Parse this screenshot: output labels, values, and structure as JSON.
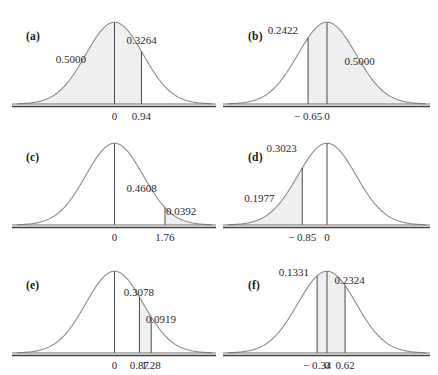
{
  "figure": {
    "top_fragment": "",
    "curve_color": "#8c8c8c",
    "fill_color": "#efefef",
    "shade_color": "#e2e2e2",
    "axis_color": "#6f6f6f",
    "rule_color": "#3d3d3d"
  },
  "chart_data": {
    "type": "area",
    "title": "",
    "xlabel": "",
    "ylabel": "",
    "distribution": "standard normal",
    "xlim": [
      -3.4,
      3.4
    ],
    "ylim": [
      0,
      0.4
    ],
    "grid": false,
    "legend": null,
    "panels": [
      {
        "id": "a",
        "label": "(a)",
        "ticks": [
          {
            "value": 0,
            "text": "0"
          },
          {
            "value": 0.94,
            "text": "0.94"
          }
        ],
        "rules": [
          0,
          0.94
        ],
        "shaded": [
          {
            "from": -3.4,
            "to": 0.94
          }
        ],
        "annotations": [
          {
            "text": "0.5000",
            "x": -1.42,
            "y": 0.215
          },
          {
            "text": "0.3264",
            "x": 1.05,
            "y": 0.305
          }
        ]
      },
      {
        "id": "b",
        "label": "(b)",
        "ticks": [
          {
            "value": -0.65,
            "text": "− 0.65"
          },
          {
            "value": 0,
            "text": "0"
          }
        ],
        "rules": [
          -0.65,
          0
        ],
        "shaded": [
          {
            "from": -0.65,
            "to": 3.4
          }
        ],
        "annotations": [
          {
            "text": "0.2422",
            "x": -1.42,
            "y": 0.355
          },
          {
            "text": "0.5000",
            "x": 1.22,
            "y": 0.205
          }
        ]
      },
      {
        "id": "c",
        "label": "(c)",
        "ticks": [
          {
            "value": 0,
            "text": "0"
          },
          {
            "value": 1.76,
            "text": "1.76"
          }
        ],
        "rules": [
          0,
          1.76
        ],
        "shaded": [
          {
            "from": 1.76,
            "to": 3.4
          }
        ],
        "annotations": [
          {
            "text": "0.4608",
            "x": 1.05,
            "y": 0.175
          },
          {
            "text": "0.0392",
            "x": 2.42,
            "y": 0.062
          }
        ]
      },
      {
        "id": "d",
        "label": "(d)",
        "ticks": [
          {
            "value": -0.85,
            "text": "− 0.85"
          },
          {
            "value": 0,
            "text": "0"
          }
        ],
        "rules": [
          -0.85,
          0
        ],
        "shaded": [
          {
            "from": -3.4,
            "to": -0.85
          }
        ],
        "annotations": [
          {
            "text": "0.3023",
            "x": -1.46,
            "y": 0.372
          },
          {
            "text": "0.1977",
            "x": -2.22,
            "y": 0.125
          }
        ]
      },
      {
        "id": "e",
        "label": "(e)",
        "ticks": [
          {
            "value": 0,
            "text": "0"
          },
          {
            "value": 0.87,
            "text": "0.87"
          },
          {
            "value": 1.28,
            "text": "1.28"
          }
        ],
        "rules": [
          0,
          0.87,
          1.28
        ],
        "shaded": [
          {
            "from": 0.87,
            "to": 1.28
          }
        ],
        "annotations": [
          {
            "text": "0.3078",
            "x": 0.95,
            "y": 0.295
          },
          {
            "text": "0.0919",
            "x": 1.72,
            "y": 0.162
          }
        ]
      },
      {
        "id": "f",
        "label": "(f)",
        "ticks": [
          {
            "value": -0.34,
            "text": "− 0.34"
          },
          {
            "value": 0,
            "text": "0"
          },
          {
            "value": 0.62,
            "text": "0.62"
          }
        ],
        "rules": [
          -0.34,
          0,
          0.62
        ],
        "shaded": [
          {
            "from": -0.34,
            "to": 0.62
          }
        ],
        "annotations": [
          {
            "text": "0.1331",
            "x": -1.04,
            "y": 0.392
          },
          {
            "text": "0.2324",
            "x": 0.88,
            "y": 0.352
          }
        ]
      }
    ]
  }
}
